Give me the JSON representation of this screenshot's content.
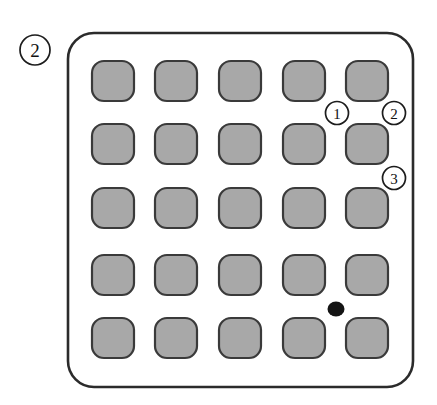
{
  "figure": {
    "type": "patent-line-drawing",
    "background_color": "#ffffff",
    "canvas": {
      "width": 437,
      "height": 405
    },
    "panel": {
      "name": "keypad-panel",
      "x": 68,
      "y": 33,
      "width": 345,
      "height": 354,
      "corner_radius": 26,
      "fill": "#ffffff",
      "stroke": "#2b2b2b",
      "stroke_width": 2.6
    },
    "grid": {
      "rows": 5,
      "columns": 5,
      "cell_width": 42,
      "cell_height": 40,
      "cell_radius": 12,
      "cell_fill": "#a8a8a8",
      "cell_stroke": "#3a3a3a",
      "column_x": [
        92,
        155,
        219,
        283,
        346
      ],
      "row_y": [
        61,
        124,
        188,
        255,
        318
      ]
    },
    "marker": {
      "name": "black-dot",
      "cx": 336,
      "cy": 309,
      "rx": 8.5,
      "ry": 7.5,
      "color": "#141414"
    },
    "callouts": [
      {
        "id": "figure-number",
        "label": "2",
        "cx": 35,
        "cy": 50,
        "r": 15,
        "size": "large"
      },
      {
        "id": "lead-1",
        "label": "1",
        "cx": 337,
        "cy": 113,
        "r": 11.5,
        "size": "small"
      },
      {
        "id": "lead-2",
        "label": "2",
        "cx": 394,
        "cy": 113,
        "r": 11.5,
        "size": "small"
      },
      {
        "id": "lead-3",
        "label": "3",
        "cx": 394,
        "cy": 178,
        "r": 11.5,
        "size": "small"
      }
    ]
  }
}
